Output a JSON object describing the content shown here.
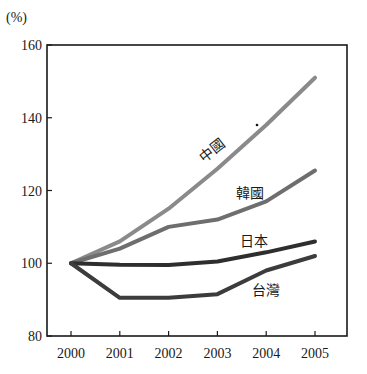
{
  "chart_data": {
    "type": "line",
    "title": "",
    "xlabel": "",
    "ylabel": "(%)",
    "x": [
      "2000",
      "2001",
      "2002",
      "2003",
      "2004",
      "2005"
    ],
    "yticks": [
      80,
      100,
      120,
      140,
      160
    ],
    "ylim": [
      80,
      160
    ],
    "grid": false,
    "legend_position": "inline labels",
    "series": [
      {
        "name": "中國",
        "color": "#8a8a8a",
        "values": [
          100,
          106,
          115,
          126,
          138,
          151
        ]
      },
      {
        "name": "韓國",
        "color": "#6e6e6e",
        "values": [
          100,
          104,
          110,
          112,
          117,
          125.5
        ]
      },
      {
        "name": "日本",
        "color": "#2e2e2e",
        "values": [
          100,
          99.6,
          99.5,
          100.5,
          103,
          106
        ]
      },
      {
        "name": "台灣",
        "color": "#3c3c3c",
        "values": [
          100,
          90.5,
          90.5,
          91.5,
          98,
          102
        ]
      }
    ]
  },
  "labels": {
    "unit": "(%)",
    "china": "中國",
    "korea": "韓國",
    "japan": "日本",
    "taiwan": "台灣"
  }
}
